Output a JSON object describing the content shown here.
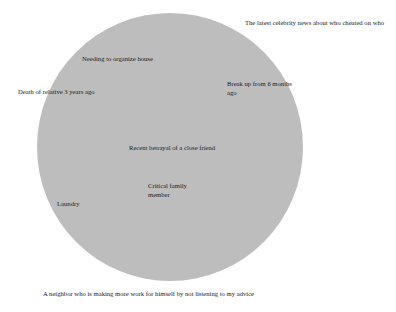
{
  "diagram": {
    "type": "circle-of-concern",
    "background_color": "#ffffff",
    "circle": {
      "name": "concern-circle",
      "fill_color": "#bdbdbd",
      "center_x": 170,
      "center_y": 147,
      "radius": 133
    },
    "text_color": "#1a1a1a",
    "labels": [
      {
        "id": "celebrity-news",
        "text": "The latest celebrity news about who cheated on who",
        "position": "outside-top-right"
      },
      {
        "id": "organize-house",
        "text": "Needing to organize house",
        "position": "inside-upper-left"
      },
      {
        "id": "break-up",
        "text": "Break up from 6 months ago",
        "position": "inside-upper-right"
      },
      {
        "id": "death-of-relative",
        "text": "Death of relative 3 years ago",
        "position": "edge-left"
      },
      {
        "id": "recent-betrayal",
        "text": "Recent betrayal of a close friend",
        "position": "inside-center"
      },
      {
        "id": "critical-family-member",
        "text": "Critical family member",
        "position": "inside-lower-center"
      },
      {
        "id": "laundry",
        "text": "Laundry",
        "position": "inside-lower-left"
      },
      {
        "id": "neighbor-advice",
        "text": "A neighbor who is making more work for himself by not listening to my advice",
        "position": "outside-bottom-left"
      }
    ]
  }
}
